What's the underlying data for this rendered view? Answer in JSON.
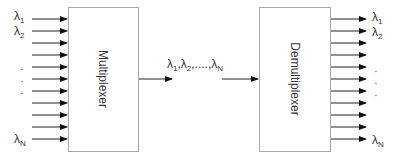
{
  "diagram": {
    "type": "wdm-mux-demux",
    "multiplexer": {
      "label": "Multiplexer"
    },
    "demultiplexer": {
      "label": "Demultiplexer"
    },
    "inputs": {
      "count": 11,
      "labels": [
        {
          "symbol": "λ",
          "sub": "1"
        },
        {
          "symbol": "λ",
          "sub": "2"
        },
        {
          "symbol": "λ",
          "sub": "N"
        }
      ],
      "ellipsis": "⋮"
    },
    "outputs": {
      "count": 11,
      "labels": [
        {
          "symbol": "λ",
          "sub": "1"
        },
        {
          "symbol": "λ",
          "sub": "2"
        },
        {
          "symbol": "λ",
          "sub": "N"
        }
      ],
      "ellipsis": "⋮"
    },
    "link": {
      "label_parts": [
        {
          "symbol": "λ",
          "sub": "1"
        },
        {
          "sep": ","
        },
        {
          "symbol": "λ",
          "sub": "2"
        },
        {
          "sep": ",....,"
        },
        {
          "symbol": "λ",
          "sub": "N"
        }
      ]
    },
    "colors": {
      "stroke": "#222222",
      "box_border": "#999999",
      "text": "#333333"
    }
  }
}
